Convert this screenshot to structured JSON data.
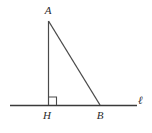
{
  "figure": {
    "kind": "geometry-diagram",
    "background_color": "#ffffff",
    "stroke_color": "#4a4a4a",
    "line_color": "#3a3a3a",
    "label_color": "#2b2b2b"
  },
  "labels": {
    "apex": "A",
    "foot": "H",
    "base_vertex": "B",
    "line": "ℓ"
  },
  "points": {
    "A": {
      "x": 48,
      "y": 21
    },
    "H": {
      "x": 48,
      "y": 105
    },
    "B": {
      "x": 100,
      "y": 105
    }
  },
  "segments": [
    {
      "name": "altitude-AH",
      "from": "A",
      "to": "H"
    },
    {
      "name": "hypotenuse-AB",
      "from": "A",
      "to": "B"
    },
    {
      "name": "line-l",
      "x1": 10,
      "y1": 105,
      "x2": 137,
      "y2": 105
    }
  ],
  "right_angle_marker": {
    "at": "H",
    "size": 8
  }
}
